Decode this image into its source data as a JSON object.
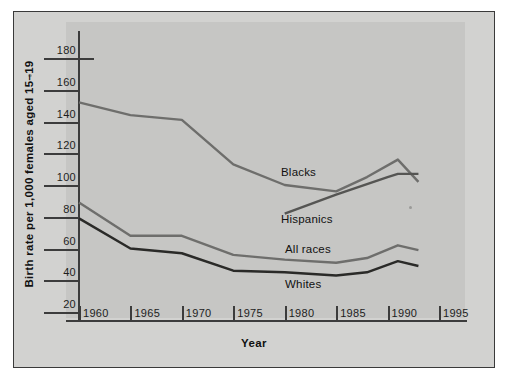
{
  "chart_data": {
    "type": "line",
    "title": "",
    "xlabel": "Year",
    "ylabel": "Birth rate per 1,000 females aged 15–19",
    "xlim": [
      1958.5,
      1996.5
    ],
    "ylim": [
      14,
      188
    ],
    "xticks": [
      1960,
      1965,
      1970,
      1975,
      1980,
      1985,
      1990,
      1995
    ],
    "xtick_labels": [
      "1960",
      "1965",
      "1970",
      "1975",
      "1980",
      "1985",
      "1990",
      "1995"
    ],
    "yticks": [
      20,
      40,
      60,
      80,
      100,
      120,
      140,
      160,
      180
    ],
    "ytick_labels": [
      "20",
      "40",
      "60",
      "80",
      "100",
      "120",
      "140",
      "160",
      "180"
    ],
    "grid": false,
    "legend": "inline-labels",
    "series": [
      {
        "name": "Blacks",
        "color": "#6e6e6c",
        "x": [
          1960,
          1965,
          1970,
          1975,
          1980,
          1985,
          1988,
          1991,
          1993
        ],
        "values": [
          152,
          144,
          141,
          113,
          100,
          96,
          105,
          116,
          102
        ]
      },
      {
        "name": "Hispanics",
        "color": "#555553",
        "x": [
          1980,
          1985,
          1990,
          1991,
          1993
        ],
        "values": [
          82,
          94,
          105,
          107,
          107
        ]
      },
      {
        "name": "All races",
        "color": "#6e6e6c",
        "x": [
          1960,
          1965,
          1970,
          1975,
          1980,
          1985,
          1988,
          1991,
          1993
        ],
        "values": [
          89,
          68,
          68,
          56,
          53,
          51,
          54,
          62,
          59
        ]
      },
      {
        "name": "Whites",
        "color": "#2a2a28",
        "x": [
          1960,
          1965,
          1970,
          1975,
          1980,
          1985,
          1988,
          1991,
          1993
        ],
        "values": [
          79,
          60,
          57,
          46,
          45,
          43,
          45,
          52,
          49
        ]
      }
    ],
    "series_labels": [
      {
        "text": "Blacks",
        "x_px": 281,
        "y_px": 166
      },
      {
        "text": "Hispanics",
        "x_px": 281,
        "y_px": 213
      },
      {
        "text": "All races",
        "x_px": 285,
        "y_px": 243
      },
      {
        "text": "Whites",
        "x_px": 285,
        "y_px": 278
      }
    ]
  },
  "axis": {
    "x_title": "Year",
    "y_title": "Birth rate per 1,000 females aged 15–19"
  },
  "colors": {
    "page_background": "#ffffff",
    "frame_background": "#d2d2d0",
    "panel_background": "#c6c6c4",
    "frame_border": "#3a3a3a",
    "axis": "#3c3c3c",
    "text": "#1d1d1d",
    "blacks_line": "#6e6e6c",
    "hispanics_line": "#555553",
    "all_races_line": "#6e6e6c",
    "whites_line": "#2a2a28"
  }
}
